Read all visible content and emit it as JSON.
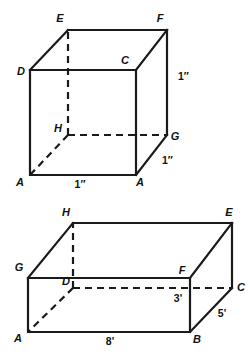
{
  "figures": [
    {
      "name": "cube-figure",
      "shape": "cube",
      "vertex_labels": {
        "A": "A",
        "B": "A",
        "C": "C",
        "D": "D",
        "E": "E",
        "F": "F",
        "G": "G",
        "H": "H"
      },
      "dimensions": {
        "width": "1″",
        "depth": "1″",
        "height": "1″"
      },
      "geometry": {
        "front_bottom_left": [
          30,
          175
        ],
        "front_bottom_right": [
          136,
          175
        ],
        "front_top_right": [
          136,
          70
        ],
        "front_top_left": [
          30,
          70
        ],
        "back_bottom_left": [
          68,
          135
        ],
        "back_bottom_right": [
          167,
          135
        ],
        "back_top_right": [
          167,
          30
        ],
        "back_top_left": [
          68,
          30
        ]
      }
    },
    {
      "name": "rectangular-prism-figure",
      "shape": "rectangular-prism",
      "vertex_labels": {
        "A": "A",
        "B": "B",
        "C": "C",
        "D": "D",
        "E": "E",
        "F": "F",
        "G": "G",
        "H": "H"
      },
      "dimensions": {
        "length": "8'",
        "depth": "5'",
        "height": "3'"
      },
      "geometry": {
        "front_bottom_left": [
          28,
          332
        ],
        "front_bottom_right": [
          190,
          332
        ],
        "front_top_right": [
          190,
          278
        ],
        "front_top_left": [
          28,
          278
        ],
        "back_bottom_left": [
          73,
          288
        ],
        "back_bottom_right": [
          232,
          288
        ],
        "back_top_right": [
          232,
          223
        ],
        "back_top_left": [
          73,
          223
        ]
      }
    }
  ],
  "colors": {
    "stroke": "#1a1a1a",
    "background": "#ffffff",
    "text": "#111111"
  }
}
